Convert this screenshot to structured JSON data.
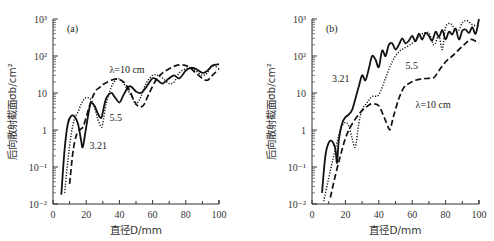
{
  "chart_data": [
    {
      "type": "line",
      "panel_label": "(a)",
      "xlabel": "直径D/mm",
      "ylabel": "后向散射截面σb/cm²",
      "xlim": [
        0,
        100
      ],
      "ylim": [
        0.01,
        1000
      ],
      "yscale": "log",
      "x_ticks": [
        "0",
        "20",
        "40",
        "60",
        "80",
        "100"
      ],
      "y_ticks": [
        "10⁻²",
        "10⁻¹",
        "1",
        "10",
        "10²",
        "10³"
      ],
      "grid": false,
      "series": [
        {
          "name": "3.21",
          "style": "solid",
          "x": [
            5,
            7,
            9,
            11,
            13,
            15,
            16,
            17,
            18,
            20,
            22,
            23,
            25,
            27,
            29,
            30,
            32,
            35,
            37,
            40,
            42,
            45,
            47,
            50,
            53,
            56,
            60,
            63,
            66,
            70,
            73,
            76,
            80,
            83,
            86,
            90,
            93,
            96,
            100
          ],
          "y": [
            0.018,
            0.3,
            1.5,
            2.4,
            2.3,
            1.5,
            0.9,
            0.5,
            0.35,
            1.2,
            4,
            5.5,
            4.5,
            2.8,
            2.1,
            3,
            7,
            10,
            8,
            5.5,
            8,
            14,
            15,
            11,
            10,
            14,
            25,
            22,
            18,
            25,
            30,
            25,
            40,
            48,
            45,
            35,
            40,
            55,
            60
          ]
        },
        {
          "name": "5.5",
          "style": "dotted",
          "x": [
            7,
            9,
            11,
            13,
            15,
            17,
            19,
            21,
            23,
            25,
            27,
            29,
            30,
            32,
            35,
            38,
            40,
            42,
            45,
            48,
            50,
            53,
            56,
            60,
            63,
            66,
            70,
            73,
            76,
            80,
            83,
            86,
            90,
            93,
            96,
            100
          ],
          "y": [
            0.02,
            0.15,
            0.8,
            2,
            3,
            5,
            7,
            7.5,
            6.5,
            4,
            2,
            1.2,
            1.5,
            5,
            14,
            23,
            24,
            20,
            12,
            7,
            5,
            8,
            18,
            30,
            30,
            25,
            18,
            20,
            35,
            45,
            48,
            40,
            30,
            35,
            55,
            45
          ]
        },
        {
          "name": "λ=10 cm",
          "style": "dashed",
          "x": [
            10,
            12,
            14,
            16,
            18,
            20,
            22,
            24,
            26,
            28,
            30,
            32,
            35,
            38,
            40,
            43,
            46,
            49,
            51,
            53,
            55,
            58,
            62,
            66,
            70,
            74,
            78,
            82,
            86,
            90,
            93,
            96,
            100
          ],
          "y": [
            0.035,
            0.25,
            0.7,
            1.0,
            1.2,
            2.2,
            4.5,
            8,
            12,
            14,
            17,
            19,
            22,
            24,
            23,
            19,
            12,
            6,
            4.5,
            4.2,
            5,
            10,
            22,
            35,
            45,
            55,
            58,
            50,
            35,
            25,
            22,
            30,
            45
          ]
        }
      ],
      "annotations": [
        {
          "text": "λ=10 cm",
          "x": 34,
          "y": 35
        },
        {
          "text": "5.5",
          "x": 34,
          "y": 1.8
        },
        {
          "text": "3.21",
          "x": 22,
          "y": 0.3
        }
      ]
    },
    {
      "type": "line",
      "panel_label": "(b)",
      "xlabel": "直径D/mm",
      "ylabel": "后向散射截面σb/cm²",
      "xlim": [
        0,
        100
      ],
      "ylim": [
        0.01,
        1000
      ],
      "yscale": "log",
      "x_ticks": [
        "0",
        "20",
        "40",
        "60",
        "80",
        "100"
      ],
      "y_ticks": [
        "10⁻²",
        "10⁻¹",
        "1",
        "10",
        "10²",
        "10³"
      ],
      "grid": false,
      "series": [
        {
          "name": "3.21",
          "style": "solid",
          "x": [
            6,
            8,
            10,
            12,
            14,
            15,
            16,
            18,
            20,
            22,
            24,
            26,
            28,
            30,
            32,
            34,
            36,
            38,
            40,
            42,
            44,
            46,
            48,
            50,
            52,
            54,
            56,
            58,
            60,
            62,
            64,
            66,
            68,
            70,
            72,
            74,
            76,
            78,
            80,
            82,
            84,
            86,
            88,
            90,
            92,
            94,
            96,
            98,
            100
          ],
          "y": [
            0.02,
            0.2,
            0.45,
            0.5,
            0.3,
            0.13,
            0.5,
            1.5,
            2.2,
            2.6,
            3.5,
            7,
            15,
            30,
            22,
            45,
            100,
            80,
            50,
            140,
            100,
            200,
            220,
            150,
            200,
            300,
            220,
            260,
            350,
            250,
            400,
            280,
            420,
            350,
            260,
            450,
            320,
            500,
            280,
            450,
            380,
            550,
            280,
            480,
            520,
            420,
            600,
            400,
            1000
          ]
        },
        {
          "name": "5.5",
          "style": "dotted",
          "x": [
            7,
            10,
            13,
            16,
            18,
            20,
            22,
            24,
            26,
            28,
            30,
            33,
            36,
            40,
            44,
            48,
            52,
            56,
            60,
            63,
            66,
            70,
            73,
            76,
            78,
            80,
            83,
            86,
            88,
            90,
            93,
            96,
            100
          ],
          "y": [
            0.012,
            0.05,
            0.2,
            0.7,
            1.3,
            1.6,
            1.3,
            0.6,
            0.35,
            1.5,
            3.5,
            5.5,
            8,
            9,
            25,
            70,
            130,
            170,
            220,
            300,
            400,
            420,
            200,
            350,
            150,
            600,
            750,
            500,
            500,
            800,
            900,
            700,
            650
          ]
        },
        {
          "name": "λ=10 cm",
          "style": "dashed",
          "x": [
            11,
            14,
            17,
            20,
            23,
            26,
            29,
            32,
            35,
            38,
            40,
            42,
            44,
            46,
            47,
            49,
            52,
            55,
            58,
            62,
            66,
            70,
            73,
            76,
            80,
            84,
            88,
            92,
            95,
            98,
            100
          ],
          "y": [
            0.015,
            0.06,
            0.2,
            0.6,
            1.2,
            2,
            3,
            4,
            5,
            5,
            4.5,
            3,
            1.8,
            1.1,
            1.1,
            2.5,
            7,
            14,
            18,
            22,
            24,
            25,
            26,
            40,
            70,
            100,
            150,
            220,
            280,
            250,
            220
          ]
        }
      ],
      "annotations": [
        {
          "text": "3.21",
          "x": 12,
          "y": 20
        },
        {
          "text": "5.5",
          "x": 56,
          "y": 45
        },
        {
          "text": "λ=10 cm",
          "x": 62,
          "y": 4
        }
      ]
    }
  ],
  "panels": [
    {
      "label": "(a)",
      "xlabel": "直径D/mm",
      "ylabel": "后向散射截面σb/cm²"
    },
    {
      "label": "(b)",
      "xlabel": "直径D/mm",
      "ylabel": "后向散射截面σb/cm²"
    }
  ]
}
